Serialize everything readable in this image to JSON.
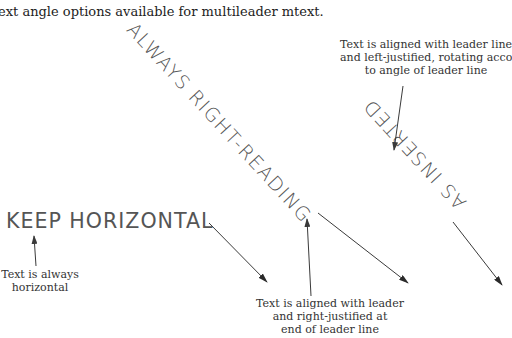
{
  "figure": {
    "caption_partial_line": "g",
    "caption": "ext angle options available for multileader mtext."
  },
  "examples": {
    "keep_horizontal": {
      "text": "KEEP HORIZONTAL",
      "note": [
        "Text is always",
        "horizontal"
      ]
    },
    "always_right_reading": {
      "text": "ALWAYS RIGHT-READING",
      "note": [
        "Text is aligned with leader",
        "and right-justified at",
        "end of leader line"
      ]
    },
    "as_inserted": {
      "text": "AS INSERTED",
      "note": [
        "Text is aligned with leader line",
        "and left-justified, rotating according",
        "to angle of leader line"
      ]
    }
  },
  "colors": {
    "background": "#ffffff",
    "leader_line": "#3a3a3a",
    "cad_text": "#555555",
    "note_text": "#333333"
  }
}
